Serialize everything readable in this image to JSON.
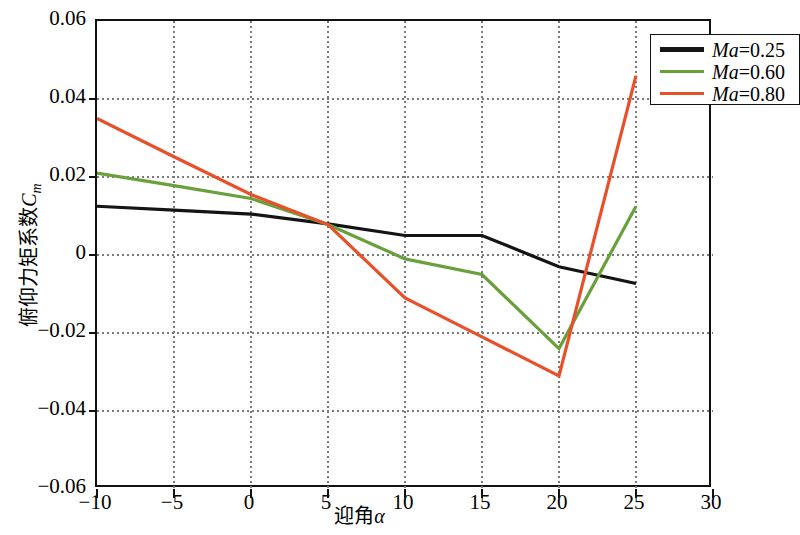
{
  "chart_data": {
    "type": "line",
    "title": "",
    "xlabel": "迎角α",
    "ylabel": "俯仰力矩系数C_m",
    "ylabel_main": "俯仰力矩系数",
    "ylabel_symbol": "C",
    "ylabel_subscript": "m",
    "xlabel_main": "迎角",
    "xlabel_symbol": "α",
    "xlim": [
      -10,
      30
    ],
    "ylim": [
      -0.06,
      0.06
    ],
    "xticks": [
      -10,
      -5,
      0,
      5,
      10,
      15,
      20,
      25,
      30
    ],
    "xticklabels": [
      "−10",
      "−5",
      "0",
      "5",
      "10",
      "15",
      "20",
      "25",
      "30"
    ],
    "yticks": [
      -0.06,
      -0.04,
      -0.02,
      0,
      0.02,
      0.04,
      0.06
    ],
    "yticklabels": [
      "−0.06",
      "−0.04",
      "−0.02",
      "0",
      "0.02",
      "0.04",
      "0.06"
    ],
    "grid": true,
    "grid_style": "dotted",
    "legend_position": "upper right",
    "x": [
      -10,
      -5,
      0,
      5,
      10,
      15,
      20,
      25
    ],
    "series": [
      {
        "name": "Ma=0.25",
        "label_prefix": "Ma",
        "label_value": "=0.25",
        "color": "#141414",
        "values": [
          0.0125,
          0.0115,
          0.0105,
          0.008,
          0.005,
          0.005,
          -0.003,
          -0.0073
        ]
      },
      {
        "name": "Ma=0.60",
        "label_prefix": "Ma",
        "label_value": "=0.60",
        "color": "#6aa03c",
        "values": [
          0.021,
          0.0178,
          0.0145,
          0.0078,
          -0.001,
          -0.005,
          -0.024,
          0.0125
        ]
      },
      {
        "name": "Ma=0.80",
        "label_prefix": "Ma",
        "label_value": "=0.80",
        "color": "#e8502a",
        "values": [
          0.035,
          0.0252,
          0.0155,
          0.0078,
          -0.011,
          -0.021,
          -0.031,
          0.046
        ]
      }
    ]
  },
  "axis": {
    "frame_color": "#111111",
    "grid_color": "#7a7a7a"
  }
}
